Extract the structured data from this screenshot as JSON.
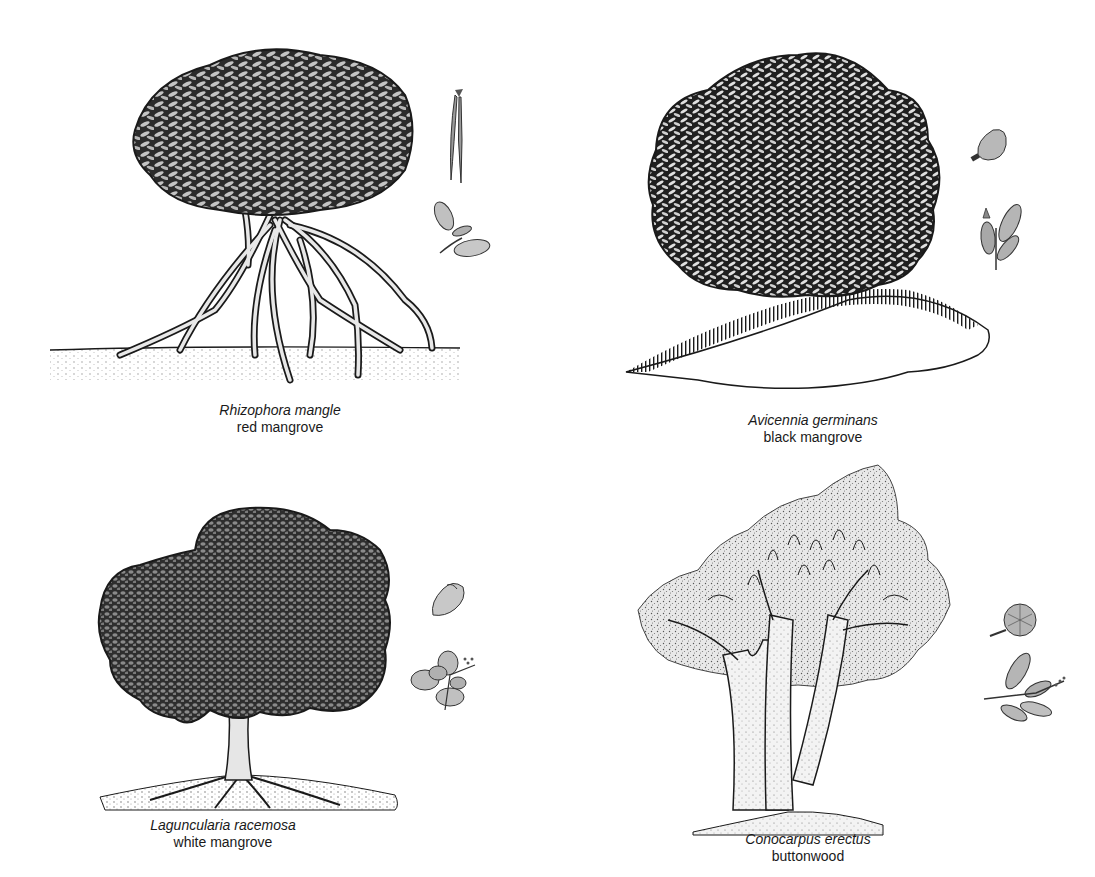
{
  "figure": {
    "type": "botanical-illustration-plate",
    "panels": [
      {
        "id": "red",
        "scientific_name": "Rhizophora mangle",
        "common_name": "red mangrove",
        "detail_icons": [
          "propagule-icon",
          "leaf-flower-sprig-icon"
        ],
        "habit": "rounded crown on arching prop roots"
      },
      {
        "id": "black",
        "scientific_name": "Avicennia germinans",
        "common_name": "black mangrove",
        "detail_icons": [
          "fruit-pod-icon",
          "leaf-flower-sprig-icon"
        ],
        "habit": "dense crown with pneumatophores on mound"
      },
      {
        "id": "white",
        "scientific_name": "Laguncularia racemosa",
        "common_name": "white mangrove",
        "detail_icons": [
          "fruit-icon",
          "round-leaf-sprig-icon"
        ],
        "habit": "broad dark crown on single trunk"
      },
      {
        "id": "buttonwood",
        "scientific_name": "Conocarpus erectus",
        "common_name": "buttonwood",
        "detail_icons": [
          "cone-fruit-icon",
          "leaf-sprig-icon"
        ],
        "habit": "stippled crown on multi-stemmed trunk"
      }
    ]
  },
  "colors": {
    "ink": "#1a1a1a",
    "crown_dark": "#2b2b2b",
    "crown_mid": "#4a4a4a",
    "leaf_light": "#bdbdbd",
    "stipple": "#9a9a9a",
    "detail_fill": "#c8c8c8",
    "background": "#ffffff"
  }
}
